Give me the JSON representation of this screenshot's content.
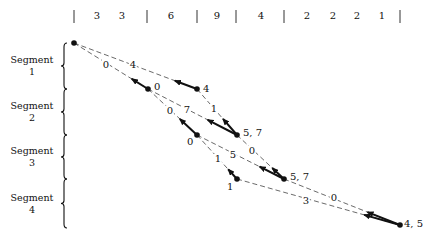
{
  "header": {
    "separators_x": [
      74,
      147,
      197,
      236,
      284,
      400
    ],
    "numbers": [
      {
        "value": "3",
        "x": 97
      },
      {
        "value": "3",
        "x": 122
      },
      {
        "value": "6",
        "x": 171
      },
      {
        "value": "9",
        "x": 217
      },
      {
        "value": "4",
        "x": 261
      },
      {
        "value": "2",
        "x": 307
      },
      {
        "value": "2",
        "x": 333
      },
      {
        "value": "2",
        "x": 357
      },
      {
        "value": "1",
        "x": 382
      }
    ]
  },
  "segments": [
    {
      "label_line1": "Segment",
      "label_line2": "1",
      "y_top": 43,
      "y_bottom": 89
    },
    {
      "label_line1": "Segment",
      "label_line2": "2",
      "y_top": 89,
      "y_bottom": 135
    },
    {
      "label_line1": "Segment",
      "label_line2": "3",
      "y_top": 135,
      "y_bottom": 179
    },
    {
      "label_line1": "Segment",
      "label_line2": "4",
      "y_top": 179,
      "y_bottom": 228
    }
  ],
  "nodes": [
    {
      "id": "A",
      "x": 74,
      "y": 43,
      "label": ""
    },
    {
      "id": "B",
      "x": 197,
      "y": 89,
      "label": "4"
    },
    {
      "id": "C",
      "x": 148,
      "y": 89,
      "label": "0"
    },
    {
      "id": "D",
      "x": 237,
      "y": 135,
      "label": "5, 7"
    },
    {
      "id": "E",
      "x": 197,
      "y": 135,
      "label": "0"
    },
    {
      "id": "F",
      "x": 284,
      "y": 179,
      "label": "5, 7"
    },
    {
      "id": "G",
      "x": 237,
      "y": 179,
      "label": "1"
    },
    {
      "id": "H",
      "x": 400,
      "y": 225,
      "label": "4, 5"
    }
  ],
  "edges": [
    {
      "from": "A",
      "to": "B",
      "label": "4",
      "lx": 133,
      "ly": 65
    },
    {
      "from": "A",
      "to": "C",
      "label": "0",
      "lx": 106,
      "ly": 65
    },
    {
      "from": "B",
      "to": "D",
      "label": "1",
      "lx": 214,
      "ly": 109
    },
    {
      "from": "C",
      "to": "D",
      "label": "7",
      "lx": 187,
      "ly": 110
    },
    {
      "from": "C",
      "to": "E",
      "label": "0",
      "lx": 170,
      "ly": 111
    },
    {
      "from": "D",
      "to": "F",
      "label": "0",
      "lx": 252,
      "ly": 151
    },
    {
      "from": "E",
      "to": "F",
      "label": "5",
      "lx": 233,
      "ly": 155
    },
    {
      "from": "E",
      "to": "G",
      "label": "1",
      "lx": 218,
      "ly": 159
    },
    {
      "from": "F",
      "to": "H",
      "label": "0",
      "lx": 334,
      "ly": 198
    },
    {
      "from": "G",
      "to": "H",
      "label": "3",
      "lx": 306,
      "ly": 201
    }
  ],
  "back_arrows": [
    {
      "from": "B",
      "toward": "A",
      "length": 0.18
    },
    {
      "from": "C",
      "toward": "A",
      "length": 0.22
    },
    {
      "from": "D",
      "toward": "C",
      "length": 0.33
    },
    {
      "from": "D",
      "toward": "B",
      "length": 0.35
    },
    {
      "from": "E",
      "toward": "C",
      "length": 0.35
    },
    {
      "from": "F",
      "toward": "E",
      "length": 0.28
    },
    {
      "from": "F",
      "toward": "D",
      "length": 0.25
    },
    {
      "from": "G",
      "toward": "E",
      "length": 0.22
    },
    {
      "from": "H",
      "toward": "G",
      "length": 0.22
    },
    {
      "from": "H",
      "toward": "F",
      "length": 0.28
    }
  ],
  "node_label_offsets": {
    "B": {
      "dx": 6,
      "dy": -6
    },
    "C": {
      "dx": 6,
      "dy": -8
    },
    "D": {
      "dx": 6,
      "dy": -8
    },
    "E": {
      "dx": -10,
      "dy": 1
    },
    "F": {
      "dx": 6,
      "dy": -8
    },
    "G": {
      "dx": -10,
      "dy": 2
    },
    "H": {
      "dx": 4,
      "dy": -7
    }
  }
}
